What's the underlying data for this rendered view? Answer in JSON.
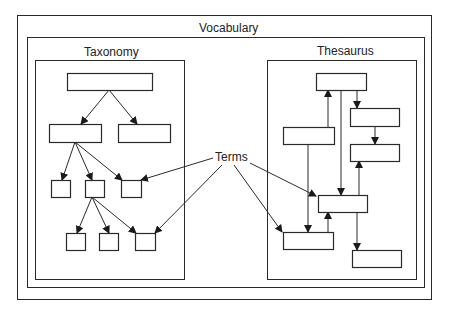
{
  "diagram": {
    "title": "Vocabulary",
    "colors": {
      "stroke": "#2a2a2a",
      "background": "#ffffff",
      "text": "#222222"
    },
    "frames": {
      "vocabulary_outer": {
        "x": 17,
        "y": 15,
        "w": 414,
        "h": 284
      },
      "vocabulary_inner": {
        "x": 27,
        "y": 37,
        "w": 397,
        "h": 250
      },
      "taxonomy": {
        "x": 35,
        "y": 60,
        "w": 149,
        "h": 219
      },
      "thesaurus": {
        "x": 267,
        "y": 60,
        "w": 149,
        "h": 219
      }
    },
    "labels": {
      "vocabulary": {
        "text": "Vocabulary",
        "x": 199,
        "y": 22
      },
      "taxonomy": {
        "text": "Taxonomy",
        "x": 84,
        "y": 46
      },
      "thesaurus": {
        "text": "Thesaurus",
        "x": 317,
        "y": 45
      },
      "terms": {
        "text": "Terms",
        "x": 215,
        "y": 151
      }
    },
    "taxonomy": {
      "nodes": [
        {
          "id": "t_root",
          "x": 67,
          "y": 73,
          "w": 85,
          "h": 17
        },
        {
          "id": "t_l2a",
          "x": 49,
          "y": 124,
          "w": 52,
          "h": 18
        },
        {
          "id": "t_l2b",
          "x": 118,
          "y": 124,
          "w": 52,
          "h": 18
        },
        {
          "id": "t_l3a",
          "x": 51,
          "y": 180,
          "w": 19,
          "h": 17
        },
        {
          "id": "t_l3b",
          "x": 85,
          "y": 180,
          "w": 19,
          "h": 17
        },
        {
          "id": "t_l3c",
          "x": 121,
          "y": 180,
          "w": 20,
          "h": 17
        },
        {
          "id": "t_l4a",
          "x": 66,
          "y": 233,
          "w": 19,
          "h": 17
        },
        {
          "id": "t_l4b",
          "x": 99,
          "y": 233,
          "w": 19,
          "h": 17
        },
        {
          "id": "t_l4c",
          "x": 135,
          "y": 233,
          "w": 20,
          "h": 17
        }
      ],
      "edges": [
        {
          "from": [
            109,
            90
          ],
          "to": [
            81,
            124
          ],
          "arrow": true
        },
        {
          "from": [
            109,
            90
          ],
          "to": [
            137,
            124
          ],
          "arrow": true
        },
        {
          "from": [
            75,
            142
          ],
          "to": [
            62,
            180
          ],
          "arrow": true
        },
        {
          "from": [
            75,
            142
          ],
          "to": [
            92,
            180
          ],
          "arrow": true
        },
        {
          "from": [
            75,
            142
          ],
          "to": [
            122,
            180
          ],
          "arrow": true
        },
        {
          "from": [
            92,
            197
          ],
          "to": [
            77,
            233
          ],
          "arrow": true
        },
        {
          "from": [
            92,
            197
          ],
          "to": [
            109,
            233
          ],
          "arrow": true
        },
        {
          "from": [
            92,
            197
          ],
          "to": [
            136,
            233
          ],
          "arrow": true
        }
      ]
    },
    "thesaurus": {
      "nodes": [
        {
          "id": "s_top",
          "x": 316,
          "y": 73,
          "w": 50,
          "h": 17
        },
        {
          "id": "s_b",
          "x": 350,
          "y": 108,
          "w": 49,
          "h": 18
        },
        {
          "id": "s_c",
          "x": 283,
          "y": 127,
          "w": 51,
          "h": 17
        },
        {
          "id": "s_d",
          "x": 350,
          "y": 144,
          "w": 49,
          "h": 17
        },
        {
          "id": "s_e",
          "x": 318,
          "y": 195,
          "w": 49,
          "h": 17
        },
        {
          "id": "s_f",
          "x": 283,
          "y": 232,
          "w": 50,
          "h": 17
        },
        {
          "id": "s_g",
          "x": 352,
          "y": 250,
          "w": 49,
          "h": 17
        }
      ],
      "edges": [
        {
          "from": [
            328,
            127
          ],
          "to": [
            328,
            90
          ],
          "arrow": true
        },
        {
          "from": [
            357,
            90
          ],
          "to": [
            357,
            108
          ],
          "arrow": true
        },
        {
          "from": [
            341,
            90
          ],
          "to": [
            341,
            195
          ],
          "arrow": true
        },
        {
          "from": [
            375,
            126
          ],
          "to": [
            375,
            144
          ],
          "arrow": true
        },
        {
          "from": [
            308,
            144
          ],
          "to": [
            308,
            232
          ],
          "arrow": true
        },
        {
          "from": [
            359,
            195
          ],
          "to": [
            359,
            161
          ],
          "arrow": true
        },
        {
          "from": [
            328,
            232
          ],
          "to": [
            328,
            212
          ],
          "arrow": true
        },
        {
          "from": [
            357,
            212
          ],
          "to": [
            357,
            250
          ],
          "arrow": true
        }
      ]
    },
    "terms_edges": [
      {
        "from": [
          213,
          158
        ],
        "to": [
          141,
          180
        ],
        "arrow": true
      },
      {
        "from": [
          222,
          165
        ],
        "to": [
          155,
          233
        ],
        "arrow": true
      },
      {
        "from": [
          250,
          163
        ],
        "to": [
          316,
          196
        ],
        "arrow": true
      },
      {
        "from": [
          234,
          165
        ],
        "to": [
          282,
          232
        ],
        "arrow": true
      }
    ]
  }
}
